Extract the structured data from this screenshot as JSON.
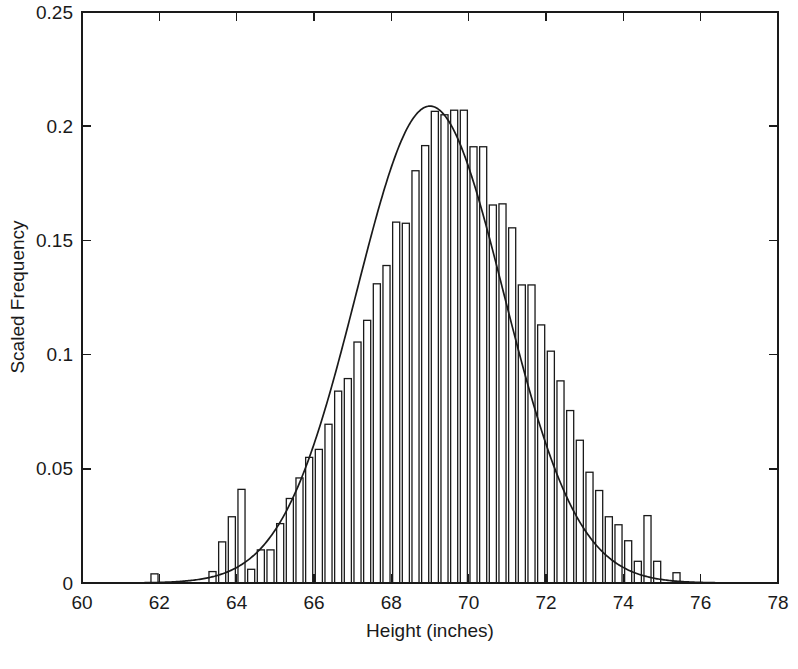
{
  "chart_data": {
    "type": "bar",
    "title": "",
    "subtitle": "",
    "xlabel": "Height (inches)",
    "ylabel": "Scaled Frequency",
    "xlim": [
      60,
      78
    ],
    "ylim": [
      0,
      0.25
    ],
    "xticks": [
      60,
      62,
      64,
      66,
      68,
      70,
      72,
      74,
      76,
      78
    ],
    "xtick_labels": [
      "60",
      "62",
      "64",
      "66",
      "68",
      "70",
      "72",
      "74",
      "76",
      "78"
    ],
    "yticks": [
      0,
      0.05,
      0.1,
      0.15,
      0.2,
      0.25
    ],
    "ytick_labels": [
      "0",
      "0.05",
      "0.1",
      "0.15",
      "0.2",
      "0.25"
    ],
    "grid": false,
    "legend": null,
    "annotations": [],
    "bin_width": 0.25,
    "bar_fill": "#ffffff",
    "bar_edge": "#1a1a1a",
    "curve_color": "#1a1a1a",
    "axis_color": "#1a1a1a",
    "background": "#ffffff",
    "categories": [
      61.875,
      62.125,
      62.375,
      62.625,
      62.875,
      63.125,
      63.375,
      63.625,
      63.875,
      64.125,
      64.375,
      64.625,
      64.875,
      65.125,
      65.375,
      65.625,
      65.875,
      66.125,
      66.375,
      66.625,
      66.875,
      67.125,
      67.375,
      67.625,
      67.875,
      68.125,
      68.375,
      68.625,
      68.875,
      69.125,
      69.375,
      69.625,
      69.875,
      70.125,
      70.375,
      70.625,
      70.875,
      71.125,
      71.375,
      71.625,
      71.875,
      72.125,
      72.375,
      72.625,
      72.875,
      73.125,
      73.375,
      73.625,
      73.875,
      74.125,
      74.375,
      74.625,
      74.875,
      75.125,
      75.375
    ],
    "values": [
      0.004,
      0.0,
      0.0,
      0.0,
      0.0,
      0.0,
      0.005,
      0.018,
      0.029,
      0.041,
      0.006,
      0.0145,
      0.0145,
      0.026,
      0.037,
      0.046,
      0.055,
      0.0585,
      0.0695,
      0.084,
      0.0895,
      0.1055,
      0.115,
      0.131,
      0.139,
      0.158,
      0.1575,
      0.1805,
      0.1915,
      0.2065,
      0.205,
      0.207,
      0.207,
      0.191,
      0.191,
      0.1655,
      0.166,
      0.1555,
      0.1305,
      0.1305,
      0.113,
      0.1015,
      0.0885,
      0.0755,
      0.0625,
      0.0485,
      0.0405,
      0.029,
      0.0255,
      0.0185,
      0.0095,
      0.0295,
      0.0095,
      0.0,
      0.0045
    ],
    "series": [
      {
        "name": "histogram",
        "kind": "bar",
        "values": [
          0.004,
          0.0,
          0.0,
          0.0,
          0.0,
          0.0,
          0.005,
          0.018,
          0.029,
          0.041,
          0.006,
          0.0145,
          0.0145,
          0.026,
          0.037,
          0.046,
          0.055,
          0.0585,
          0.0695,
          0.084,
          0.0895,
          0.1055,
          0.115,
          0.131,
          0.139,
          0.158,
          0.1575,
          0.1805,
          0.1915,
          0.2065,
          0.205,
          0.207,
          0.207,
          0.191,
          0.191,
          0.1655,
          0.166,
          0.1555,
          0.1305,
          0.1305,
          0.113,
          0.1015,
          0.0885,
          0.0755,
          0.0625,
          0.0485,
          0.0405,
          0.029,
          0.0255,
          0.0185,
          0.0095,
          0.0295,
          0.0095,
          0.0,
          0.0045
        ]
      },
      {
        "name": "normal-fit-curve",
        "kind": "line",
        "distribution": "normal",
        "mean": 69.0,
        "sigma": 1.91,
        "peak": 0.2088,
        "x_start": 60.4,
        "x_end": 76.6
      }
    ]
  }
}
